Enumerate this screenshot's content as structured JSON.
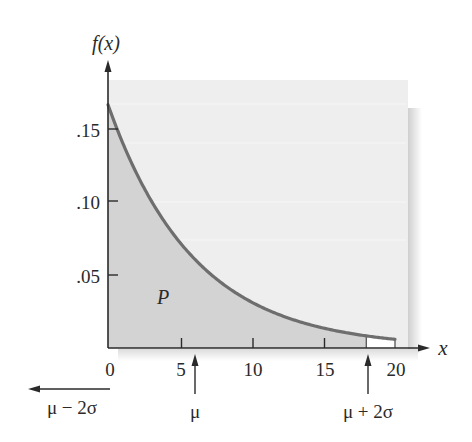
{
  "chart_data": {
    "type": "area",
    "title": "",
    "distribution": "exponential",
    "function": "f(x) = (1/6) e^(-x/6)",
    "ylabel": "f(x)",
    "xlabel": "x",
    "xlim": [
      0,
      20
    ],
    "ylim": [
      0,
      0.18
    ],
    "x_ticks": [
      0,
      5,
      10,
      15,
      20
    ],
    "x_tick_labels": [
      "0",
      "5",
      "10",
      "15",
      "20"
    ],
    "y_ticks": [
      0.05,
      0.1,
      0.15
    ],
    "y_tick_labels": [
      ".05",
      ".10",
      ".15"
    ],
    "x": [
      0,
      1,
      2,
      3,
      4,
      5,
      6,
      7,
      8,
      9,
      10,
      11,
      12,
      13,
      14,
      15,
      16,
      17,
      18,
      19,
      20
    ],
    "values": [
      0.1667,
      0.1411,
      0.1194,
      0.1011,
      0.0856,
      0.0724,
      0.0613,
      0.0519,
      0.0439,
      0.0372,
      0.0315,
      0.0266,
      0.0226,
      0.0191,
      0.0162,
      0.0137,
      0.0116,
      0.0098,
      0.0083,
      0.007,
      0.0059
    ],
    "shaded_region": {
      "from": 0,
      "to": 18,
      "label": "P"
    },
    "annotations": [
      {
        "label": "μ − 2σ",
        "x": -6,
        "marker": "left-arrow"
      },
      {
        "label": "μ",
        "x": 6,
        "marker": "up-arrow"
      },
      {
        "label": "μ + 2σ",
        "x": 18,
        "marker": "up-arrow"
      }
    ],
    "grid": false,
    "legend": null
  },
  "labels": {
    "y_axis": "f(x)",
    "x_axis": "x",
    "area": "P",
    "mu_minus": "μ − 2σ",
    "mu": "μ",
    "mu_plus": "μ + 2σ",
    "ytick_15": ".15",
    "ytick_10": ".10",
    "ytick_05": ".05",
    "xtick_0": "0",
    "xtick_5": "5",
    "xtick_10": "10",
    "xtick_15": "15",
    "xtick_20": "20"
  },
  "colors": {
    "panel": "#eeeeee",
    "shaded": "#d3d3d3",
    "curve": "#6e6e6e",
    "axis": "#2a2a2a"
  }
}
